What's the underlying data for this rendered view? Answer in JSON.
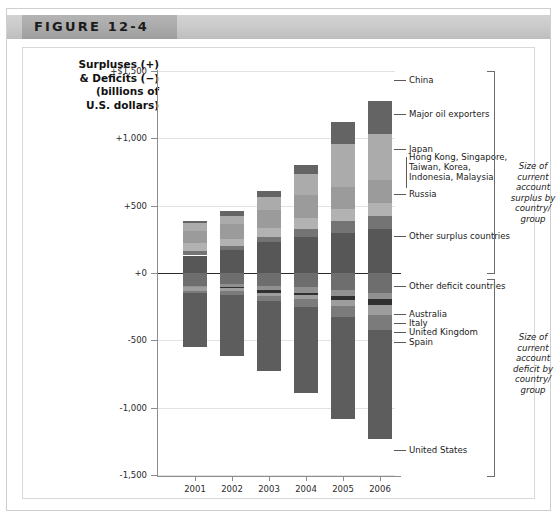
{
  "figure": {
    "label": "FIGURE 12-4"
  },
  "axis_title": "Surpluses (+)\n& Deficits (−)\n(billions of\nU.S. dollars)",
  "group_brackets": {
    "surplus": "Size of\ncurrent\naccount\nsurplus by\ncountry/\ngroup",
    "deficit": "Size of\ncurrent\naccount\ndeficit by\ncountry/\ngroup"
  },
  "callouts": [
    {
      "label": "China",
      "y": 79
    },
    {
      "label": "Major oil exporters",
      "y": 113
    },
    {
      "label": "Japan",
      "y": 148
    },
    {
      "label": "Hong Kong, Singapore,\nTaiwan, Korea,\nIndonesia, Malaysia",
      "y": 160
    },
    {
      "label": "Russia",
      "y": 193
    },
    {
      "label": "Other surplus countries",
      "y": 235
    },
    {
      "label": "Other deficit countries",
      "y": 285
    },
    {
      "label": "Australia",
      "y": 313
    },
    {
      "label": "Italy",
      "y": 322
    },
    {
      "label": "United Kingdom",
      "y": 331
    },
    {
      "label": "Spain",
      "y": 341
    },
    {
      "label": "United States",
      "y": 449
    }
  ],
  "chart_data": {
    "type": "bar",
    "subtype": "stacked-diverging",
    "title": "FIGURE 12-4",
    "xlabel": "",
    "ylabel": "Surpluses (+) & Deficits (−) (billions of U.S. dollars)",
    "ylim": [
      -1500,
      1500
    ],
    "ytick_labels": [
      "+$1,500",
      "+1,000",
      "+500",
      "+0",
      "-500",
      "-1,000",
      "-1,500"
    ],
    "ytick_values": [
      1500,
      1000,
      500,
      0,
      -500,
      -1000,
      -1500
    ],
    "grid": true,
    "legend_position": "right-callouts",
    "categories": [
      "2001",
      "2002",
      "2003",
      "2004",
      "2005",
      "2006"
    ],
    "surplus_series": [
      {
        "name": "Other surplus countries",
        "color": "#575757",
        "values": [
          130,
          170,
          230,
          265,
          300,
          330
        ]
      },
      {
        "name": "Russia",
        "color": "#737373",
        "values": [
          35,
          30,
          35,
          60,
          85,
          95
        ]
      },
      {
        "name": "Hong Kong, Singapore, Taiwan, Korea, Indonesia, Malaysia",
        "color": "#b0b0b0",
        "values": [
          60,
          55,
          70,
          80,
          90,
          95
        ]
      },
      {
        "name": "Japan",
        "color": "#9a9a9a",
        "values": [
          88,
          112,
          136,
          172,
          166,
          170
        ]
      },
      {
        "name": "Major oil exporters",
        "color": "#a9a9a9",
        "values": [
          55,
          60,
          90,
          155,
          320,
          340
        ]
      },
      {
        "name": "China",
        "color": "#636363",
        "values": [
          17,
          35,
          46,
          69,
          161,
          250
        ]
      }
    ],
    "deficit_series": [
      {
        "name": "Other deficit countries",
        "color": "#6e6e6e",
        "values": [
          -95,
          -85,
          -95,
          -105,
          -130,
          -150
        ]
      },
      {
        "name": "Australia",
        "color": "#8f8f8f",
        "values": [
          -8,
          -16,
          -30,
          -40,
          -41,
          -41
        ]
      },
      {
        "name": "Italy",
        "color": "#2f2f2f",
        "values": [
          -1,
          -10,
          -20,
          -16,
          -28,
          -45
        ]
      },
      {
        "name": "United Kingdom",
        "color": "#9c9c9c",
        "values": [
          -30,
          -25,
          -28,
          -35,
          -48,
          -78
        ]
      },
      {
        "name": "Spain",
        "color": "#7a7a7a",
        "values": [
          -18,
          -24,
          -32,
          -55,
          -83,
          -107
        ]
      },
      {
        "name": "United States",
        "color": "#5c5c5c",
        "values": [
          -398,
          -459,
          -522,
          -640,
          -755,
          -812
        ]
      }
    ]
  },
  "bars": [
    {
      "year": "2001",
      "x": 160,
      "width": 24,
      "positive": [
        {
          "name": "Other surplus countries",
          "v": 130,
          "color": "#575757"
        },
        {
          "name": "Russia",
          "v": 35,
          "color": "#747474"
        },
        {
          "name": "HK/SG/TW/KR/ID/MY",
          "v": 60,
          "color": "#b2b2b2"
        },
        {
          "name": "Japan",
          "v": 88,
          "color": "#9b9b9b"
        },
        {
          "name": "Major oil exporters",
          "v": 55,
          "color": "#ababab"
        },
        {
          "name": "China",
          "v": 17,
          "color": "#646464"
        }
      ],
      "negative": [
        {
          "name": "Other deficit countries",
          "v": 95,
          "color": "#6e6e6e"
        },
        {
          "name": "Australia",
          "v": 8,
          "color": "#909090"
        },
        {
          "name": "Italy",
          "v": 1,
          "color": "#303030"
        },
        {
          "name": "United Kingdom",
          "v": 30,
          "color": "#9d9d9d"
        },
        {
          "name": "Spain",
          "v": 18,
          "color": "#7b7b7b"
        },
        {
          "name": "United States",
          "v": 398,
          "color": "#5d5d5d"
        }
      ]
    },
    {
      "year": "2002",
      "x": 197,
      "width": 24,
      "positive": [
        {
          "name": "Other surplus countries",
          "v": 170,
          "color": "#575757"
        },
        {
          "name": "Russia",
          "v": 30,
          "color": "#747474"
        },
        {
          "name": "HK/SG/TW/KR/ID/MY",
          "v": 55,
          "color": "#b2b2b2"
        },
        {
          "name": "Japan",
          "v": 112,
          "color": "#9b9b9b"
        },
        {
          "name": "Major oil exporters",
          "v": 60,
          "color": "#ababab"
        },
        {
          "name": "China",
          "v": 35,
          "color": "#646464"
        }
      ],
      "negative": [
        {
          "name": "Other deficit countries",
          "v": 85,
          "color": "#6e6e6e"
        },
        {
          "name": "Australia",
          "v": 16,
          "color": "#909090"
        },
        {
          "name": "Italy",
          "v": 10,
          "color": "#303030"
        },
        {
          "name": "United Kingdom",
          "v": 25,
          "color": "#9d9d9d"
        },
        {
          "name": "Spain",
          "v": 24,
          "color": "#7b7b7b"
        },
        {
          "name": "United States",
          "v": 459,
          "color": "#5d5d5d"
        }
      ]
    },
    {
      "year": "2003",
      "x": 234,
      "width": 24,
      "positive": [
        {
          "name": "Other surplus countries",
          "v": 230,
          "color": "#575757"
        },
        {
          "name": "Russia",
          "v": 35,
          "color": "#747474"
        },
        {
          "name": "HK/SG/TW/KR/ID/MY",
          "v": 70,
          "color": "#b2b2b2"
        },
        {
          "name": "Japan",
          "v": 136,
          "color": "#9b9b9b"
        },
        {
          "name": "Major oil exporters",
          "v": 90,
          "color": "#ababab"
        },
        {
          "name": "China",
          "v": 46,
          "color": "#646464"
        }
      ],
      "negative": [
        {
          "name": "Other deficit countries",
          "v": 95,
          "color": "#6e6e6e"
        },
        {
          "name": "Australia",
          "v": 30,
          "color": "#909090"
        },
        {
          "name": "Italy",
          "v": 20,
          "color": "#303030"
        },
        {
          "name": "United Kingdom",
          "v": 28,
          "color": "#9d9d9d"
        },
        {
          "name": "Spain",
          "v": 32,
          "color": "#7b7b7b"
        },
        {
          "name": "United States",
          "v": 522,
          "color": "#5d5d5d"
        }
      ]
    },
    {
      "year": "2004",
      "x": 271,
      "width": 24,
      "positive": [
        {
          "name": "Other surplus countries",
          "v": 265,
          "color": "#575757"
        },
        {
          "name": "Russia",
          "v": 60,
          "color": "#747474"
        },
        {
          "name": "HK/SG/TW/KR/ID/MY",
          "v": 80,
          "color": "#b2b2b2"
        },
        {
          "name": "Japan",
          "v": 172,
          "color": "#9b9b9b"
        },
        {
          "name": "Major oil exporters",
          "v": 155,
          "color": "#ababab"
        },
        {
          "name": "China",
          "v": 69,
          "color": "#646464"
        }
      ],
      "negative": [
        {
          "name": "Other deficit countries",
          "v": 105,
          "color": "#6e6e6e"
        },
        {
          "name": "Australia",
          "v": 40,
          "color": "#909090"
        },
        {
          "name": "Italy",
          "v": 16,
          "color": "#303030"
        },
        {
          "name": "United Kingdom",
          "v": 35,
          "color": "#9d9d9d"
        },
        {
          "name": "Spain",
          "v": 55,
          "color": "#7b7b7b"
        },
        {
          "name": "United States",
          "v": 640,
          "color": "#5d5d5d"
        }
      ]
    },
    {
      "year": "2005",
      "x": 308,
      "width": 24,
      "positive": [
        {
          "name": "Other surplus countries",
          "v": 300,
          "color": "#575757"
        },
        {
          "name": "Russia",
          "v": 85,
          "color": "#747474"
        },
        {
          "name": "HK/SG/TW/KR/ID/MY",
          "v": 90,
          "color": "#b2b2b2"
        },
        {
          "name": "Japan",
          "v": 166,
          "color": "#9b9b9b"
        },
        {
          "name": "Major oil exporters",
          "v": 320,
          "color": "#ababab"
        },
        {
          "name": "China",
          "v": 161,
          "color": "#646464"
        }
      ],
      "negative": [
        {
          "name": "Other deficit countries",
          "v": 130,
          "color": "#6e6e6e"
        },
        {
          "name": "Australia",
          "v": 41,
          "color": "#909090"
        },
        {
          "name": "Italy",
          "v": 28,
          "color": "#303030"
        },
        {
          "name": "United Kingdom",
          "v": 48,
          "color": "#9d9d9d"
        },
        {
          "name": "Spain",
          "v": 83,
          "color": "#7b7b7b"
        },
        {
          "name": "United States",
          "v": 755,
          "color": "#5d5d5d"
        }
      ]
    },
    {
      "year": "2006",
      "x": 345,
      "width": 24,
      "positive": [
        {
          "name": "Other surplus countries",
          "v": 330,
          "color": "#575757"
        },
        {
          "name": "Russia",
          "v": 95,
          "color": "#747474"
        },
        {
          "name": "HK/SG/TW/KR/ID/MY",
          "v": 95,
          "color": "#b2b2b2"
        },
        {
          "name": "Japan",
          "v": 170,
          "color": "#9b9b9b"
        },
        {
          "name": "Major oil exporters",
          "v": 340,
          "color": "#ababab"
        },
        {
          "name": "China",
          "v": 250,
          "color": "#646464"
        }
      ],
      "negative": [
        {
          "name": "Other deficit countries",
          "v": 150,
          "color": "#6e6e6e"
        },
        {
          "name": "Australia",
          "v": 41,
          "color": "#909090"
        },
        {
          "name": "Italy",
          "v": 45,
          "color": "#303030"
        },
        {
          "name": "United Kingdom",
          "v": 78,
          "color": "#9d9d9d"
        },
        {
          "name": "Spain",
          "v": 107,
          "color": "#7b7b7b"
        },
        {
          "name": "United States",
          "v": 812,
          "color": "#5d5d5d"
        }
      ]
    }
  ]
}
